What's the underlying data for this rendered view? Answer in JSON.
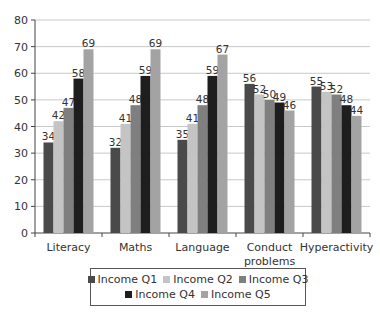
{
  "chart_data": {
    "type": "bar",
    "title": "",
    "xlabel": "",
    "ylabel": "",
    "ylim": [
      0,
      80
    ],
    "yticks": [
      0,
      10,
      20,
      30,
      40,
      50,
      60,
      70,
      80
    ],
    "grid": true,
    "legend_position": "bottom",
    "categories": [
      "Literacy",
      "Maths",
      "Language",
      "Conduct problems",
      "Hyperactivity"
    ],
    "series": [
      {
        "name": "Income Q1",
        "color": "#4a4a4a",
        "values": [
          34,
          32,
          35,
          56,
          55
        ]
      },
      {
        "name": "Income Q2",
        "color": "#c4c4c4",
        "values": [
          42,
          41,
          41,
          52,
          53
        ]
      },
      {
        "name": "Income Q3",
        "color": "#7f7f7f",
        "values": [
          47,
          48,
          48,
          50,
          52
        ]
      },
      {
        "name": "Income Q4",
        "color": "#1e1e1e",
        "values": [
          58,
          59,
          59,
          49,
          48
        ]
      },
      {
        "name": "Income Q5",
        "color": "#a3a3a3",
        "values": [
          69,
          69,
          67,
          46,
          44
        ]
      }
    ]
  },
  "legend": {
    "rows": [
      [
        "Income Q1",
        "Income Q2",
        "Income Q3"
      ],
      [
        "Income Q4",
        "Income Q5"
      ]
    ]
  }
}
